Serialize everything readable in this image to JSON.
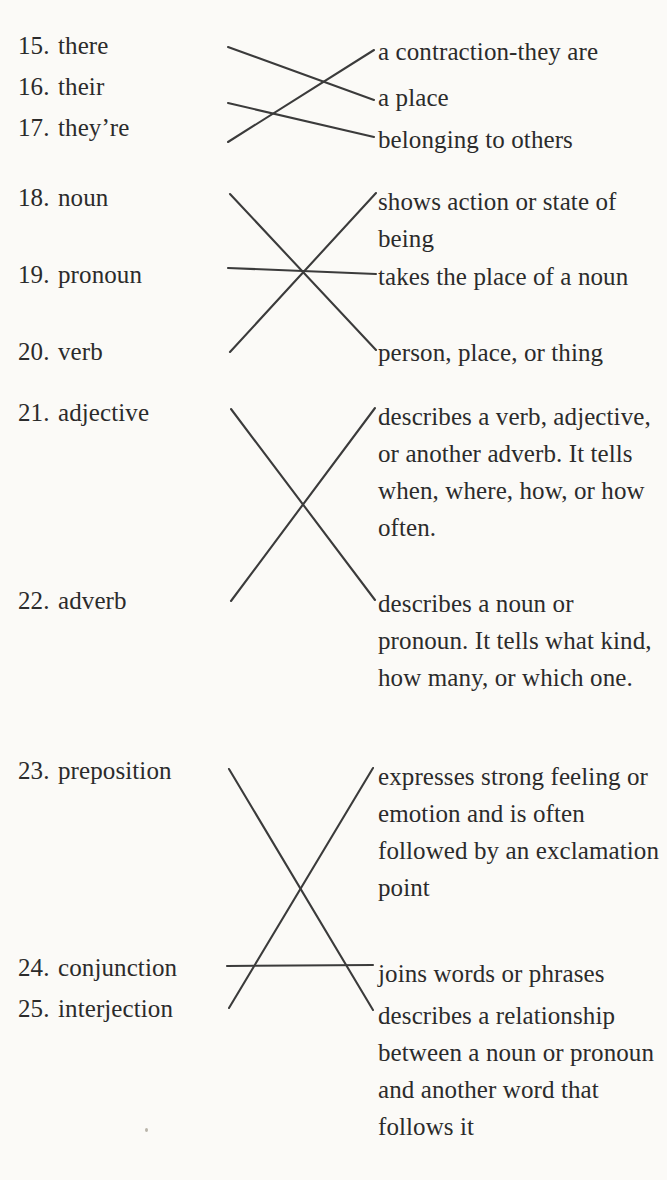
{
  "page": {
    "background_color": "#fbfaf7",
    "ink_color": "#2b2b2b",
    "line_color": "#3b3b3b",
    "kind": "matching-exercise-worksheet"
  },
  "groups": [
    {
      "id": "group-there-their-theyre",
      "terms": [
        {
          "number": "15.",
          "label": "there",
          "top": 33
        },
        {
          "number": "16.",
          "label": "their",
          "top": 74
        },
        {
          "number": "17.",
          "label": "they’re",
          "top": 115
        }
      ],
      "definitions": [
        {
          "text": "a contraction-they are",
          "top": 33
        },
        {
          "text": "a place",
          "top": 79
        },
        {
          "text": "belonging to others",
          "top": 121
        }
      ],
      "connectors": [
        {
          "from": "15. there",
          "to": "a place",
          "x1": 228,
          "y1": 47,
          "x2": 374,
          "y2": 100
        },
        {
          "from": "16. their",
          "to": "belonging to others",
          "x1": 228,
          "y1": 103,
          "x2": 374,
          "y2": 137
        },
        {
          "from": "17. they’re",
          "to": "a contraction-they are",
          "x1": 228,
          "y1": 142,
          "x2": 374,
          "y2": 50
        }
      ]
    },
    {
      "id": "group-noun-pronoun-verb",
      "terms": [
        {
          "number": "18.",
          "label": "noun",
          "top": 185
        },
        {
          "number": "19.",
          "label": "pronoun",
          "top": 262
        },
        {
          "number": "20.",
          "label": "verb",
          "top": 339
        }
      ],
      "definitions": [
        {
          "text": "shows action or state of being",
          "top": 183
        },
        {
          "text": "takes the place of a noun",
          "top": 258
        },
        {
          "text": "person, place, or thing",
          "top": 334
        }
      ],
      "connectors": [
        {
          "from": "18. noun",
          "to": "person, place, or thing",
          "x1": 230,
          "y1": 194,
          "x2": 376,
          "y2": 350
        },
        {
          "from": "19. pronoun",
          "to": "takes the place of a noun",
          "x1": 228,
          "y1": 268,
          "x2": 376,
          "y2": 274
        },
        {
          "from": "20. verb",
          "to": "shows action or state of being",
          "x1": 230,
          "y1": 352,
          "x2": 376,
          "y2": 193
        }
      ]
    },
    {
      "id": "group-adjective-adverb",
      "terms": [
        {
          "number": "21.",
          "label": "adjective",
          "top": 400
        },
        {
          "number": "22.",
          "label": "adverb",
          "top": 588
        }
      ],
      "definitions": [
        {
          "text": "describes a verb, adjective, or another adverb. It tells when, where, how, or how often.",
          "top": 398
        },
        {
          "text": "describes a noun or pronoun. It tells what kind, how many, or which one.",
          "top": 585
        }
      ],
      "connectors": [
        {
          "from": "21. adjective",
          "to": "describes a noun or pronoun. It tells what kind, how many, or which one.",
          "x1": 231,
          "y1": 409,
          "x2": 375,
          "y2": 600
        },
        {
          "from": "22. adverb",
          "to": "describes a verb, adjective, or another adverb. It tells when, where, how, or how often.",
          "x1": 231,
          "y1": 601,
          "x2": 375,
          "y2": 408
        }
      ]
    },
    {
      "id": "group-preposition-conjunction-interjection",
      "terms": [
        {
          "number": "23.",
          "label": "preposition",
          "top": 758
        },
        {
          "number": "24.",
          "label": "conjunction",
          "top": 955
        },
        {
          "number": "25.",
          "label": "interjection",
          "top": 996
        }
      ],
      "definitions": [
        {
          "text": "expresses strong feeling or emotion and is often followed by an exclamation point",
          "top": 758
        },
        {
          "text": "joins words or phrases",
          "top": 955
        },
        {
          "text": "describes a relationship between a noun or pronoun and another word that follows it",
          "top": 997
        }
      ],
      "connectors": [
        {
          "from": "23. preposition",
          "to": "describes a relationship between a noun or pronoun and another word that follows it",
          "x1": 229,
          "y1": 769,
          "x2": 373,
          "y2": 1010
        },
        {
          "from": "24. conjunction",
          "to": "joins words or phrases",
          "x1": 227,
          "y1": 966,
          "x2": 373,
          "y2": 965
        },
        {
          "from": "25. interjection",
          "to": "expresses strong feeling or emotion and is often followed by an exclamation point",
          "x1": 229,
          "y1": 1008,
          "x2": 373,
          "y2": 768
        }
      ]
    }
  ]
}
